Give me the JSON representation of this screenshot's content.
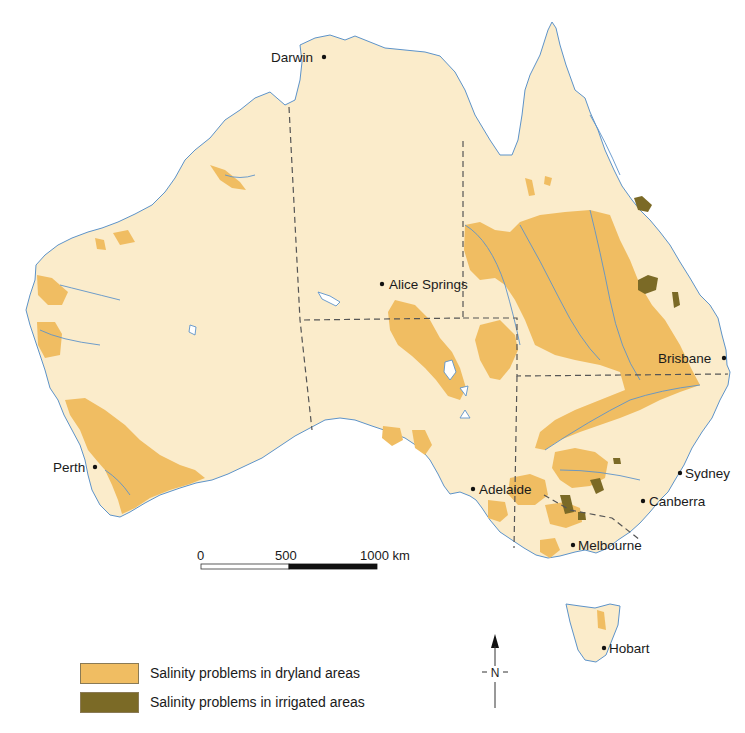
{
  "map": {
    "subject": "Salinity problems in Australia",
    "colors": {
      "land": "#fbeccb",
      "dryland_salinity": "#f0bd62",
      "irrigated_salinity": "#7b6a26",
      "water": "#4a86c8",
      "border": "#555555"
    },
    "cities": [
      {
        "name": "Darwin",
        "x": 324,
        "y": 57
      },
      {
        "name": "Alice Springs",
        "x": 382,
        "y": 284
      },
      {
        "name": "Brisbane",
        "x": 724,
        "y": 358
      },
      {
        "name": "Perth",
        "x": 95,
        "y": 467
      },
      {
        "name": "Sydney",
        "x": 680,
        "y": 473
      },
      {
        "name": "Adelaide",
        "x": 473,
        "y": 489
      },
      {
        "name": "Canberra",
        "x": 643,
        "y": 501
      },
      {
        "name": "Melbourne",
        "x": 573,
        "y": 545
      },
      {
        "name": "Hobart",
        "x": 604,
        "y": 648
      }
    ],
    "scale_bar": {
      "ticks": [
        "0",
        "500",
        "1000 km"
      ]
    },
    "north_arrow": {
      "label": "N"
    }
  },
  "legend": {
    "items": [
      {
        "label": "Salinity problems in dryland areas",
        "color": "#f0bd62"
      },
      {
        "label": "Salinity problems in irrigated areas",
        "color": "#7b6a26"
      }
    ]
  }
}
